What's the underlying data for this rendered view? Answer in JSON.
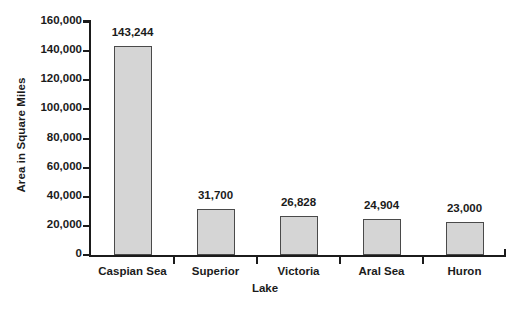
{
  "chart_data": {
    "type": "bar",
    "title": "",
    "xlabel": "Lake",
    "ylabel": "Area in Square Miles",
    "categories": [
      "Caspian Sea",
      "Superior",
      "Victoria",
      "Aral Sea",
      "Huron"
    ],
    "values": [
      143244,
      31700,
      26828,
      24904,
      23000
    ],
    "value_labels": [
      "143,244",
      "31,700",
      "26,828",
      "24,904",
      "23,000"
    ],
    "ylim": [
      0,
      160000
    ],
    "ytick_values": [
      160000,
      140000,
      120000,
      100000,
      80000,
      60000,
      40000,
      20000,
      0
    ],
    "ytick_labels": [
      "160,000",
      "140,000",
      "120,000",
      "100,000",
      "80,000",
      "60,000",
      "40,000",
      "20,000",
      "0"
    ],
    "grid": false,
    "legend": false,
    "series": [
      {
        "name": "Area",
        "values": [
          143244,
          31700,
          26828,
          24904,
          23000
        ]
      }
    ],
    "colors": {
      "bar_fill": "#d5d5d5",
      "bar_border": "#4a4a4a",
      "axis": "#1b1b1b",
      "text": "#1b1b1b",
      "background": "#ffffff"
    }
  }
}
